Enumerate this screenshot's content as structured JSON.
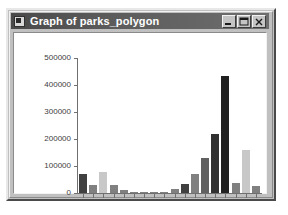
{
  "window": {
    "title": "Graph of parks_polygon",
    "icon": "app-icon",
    "controls": {
      "minimize_label": "_",
      "maximize_label": "☐",
      "close_label": "×"
    }
  },
  "colors": {
    "titlebar_start": "#4a4a4a",
    "titlebar_end": "#6e6e6e",
    "window_face": "#c0c0c0",
    "plot_background": "#ffffff",
    "axis": "#707070",
    "bar_dark": "#404040",
    "bar_mid": "#808080",
    "bar_light": "#c8c8c8"
  },
  "chart_data": {
    "type": "bar",
    "title": "Graph of parks_polygon",
    "xlabel": "",
    "ylabel": "",
    "ylim": [
      0,
      500000
    ],
    "yticks": [
      0,
      100000,
      200000,
      300000,
      400000,
      500000
    ],
    "ytick_labels": [
      "0",
      "100000",
      "200000",
      "300000",
      "400000",
      "500000"
    ],
    "grid": false,
    "legend": "none",
    "categories": [
      "1",
      "2",
      "3",
      "4",
      "5",
      "6",
      "7",
      "8",
      "9",
      "10",
      "11",
      "12",
      "13",
      "14",
      "15",
      "16",
      "17",
      "18"
    ],
    "values": [
      70000,
      30000,
      78000,
      28000,
      12000,
      2000,
      2000,
      2000,
      2000,
      13000,
      32000,
      70000,
      130000,
      220000,
      432000,
      38000,
      160000,
      25000
    ],
    "bar_colors": [
      "#404040",
      "#808080",
      "#c8c8c8",
      "#808080",
      "#808080",
      "#808080",
      "#808080",
      "#808080",
      "#808080",
      "#808080",
      "#404040",
      "#808080",
      "#606060",
      "#303030",
      "#202020",
      "#808080",
      "#c8c8c8",
      "#808080"
    ]
  }
}
